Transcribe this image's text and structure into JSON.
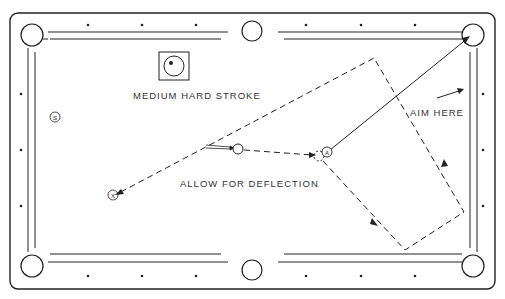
{
  "diagram": {
    "colors": {
      "line": "#222222",
      "background": "#ffffff",
      "text": "#333333"
    },
    "labels": {
      "stroke": "MEDIUM HARD STROKE",
      "deflection": "ALLOW FOR DEFLECTION",
      "aim": "AIM HERE"
    },
    "balls": {
      "object_ball": "A",
      "stripe_ball": "S",
      "target_mark": "X"
    },
    "english_icon": "cue-ball-english-top-left-icon"
  }
}
